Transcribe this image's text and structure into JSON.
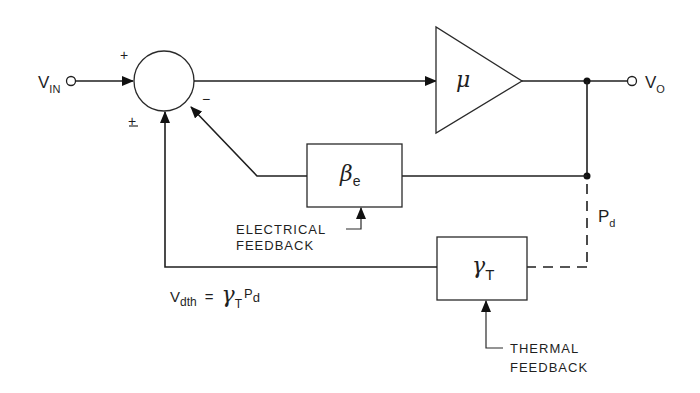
{
  "diagram": {
    "type": "block-diagram",
    "input": {
      "label": "V",
      "subscript": "IN"
    },
    "output": {
      "label": "V",
      "subscript": "O"
    },
    "summing_junction": {
      "signs": {
        "input": "+",
        "electrical_feedback": "−",
        "thermal_feedback": "±"
      }
    },
    "amplifier": {
      "symbol": "μ"
    },
    "electrical_feedback_block": {
      "symbol": "β",
      "subscript": "e",
      "caption_line1": "ELECTRICAL",
      "caption_line2": "FEEDBACK"
    },
    "thermal_feedback_block": {
      "symbol": "γ",
      "subscript": "T",
      "caption_line1": "THERMAL",
      "caption_line2": "FEEDBACK"
    },
    "power_dissipation": {
      "label": "P",
      "subscript": "d"
    },
    "equation": {
      "lhs": "V",
      "lhs_sub": "dth",
      "equals": "=",
      "rhs_symbol": "γ",
      "rhs_sub": "T",
      "rhs_var": "P",
      "rhs_var_sub": "d"
    },
    "colors": {
      "ink": "#1f1f1f",
      "background": "#ffffff"
    }
  }
}
